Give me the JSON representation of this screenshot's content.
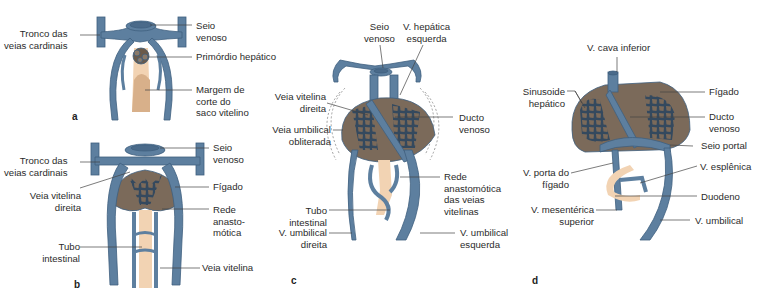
{
  "colors": {
    "vein": "#5d7f9f",
    "vein_dark": "#3f5f7f",
    "liver": "#7b6a5a",
    "intestine": "#f2d3b3",
    "hepatic_primordium": "#6a5a4a",
    "leader_line": "#444444",
    "text": "#2b2b2b"
  },
  "panels": {
    "a": {
      "letter": "a",
      "labels": {
        "tronco": "Tronco das\nveias cardinais",
        "seio": "Seio\nvenoso",
        "primordio": "Primórdio hepático",
        "margem": "Margem de\ncorte do\nsaco vitelino"
      }
    },
    "b": {
      "letter": "b",
      "labels": {
        "tronco": "Tronco das\nveias cardinais",
        "seio": "Seio\nvenoso",
        "vitelina_direita": "Veia vitelina\ndireita",
        "figado": "Fígado",
        "rede": "Rede\nanasto-\nmótica",
        "tubo": "Tubo\nintestinal",
        "veia_vitelina": "Veia vitelina"
      }
    },
    "c": {
      "letter": "c",
      "labels": {
        "seio": "Seio\nvenoso",
        "hepatica_esq": "V. hepática\nesquerda",
        "vitelina_direita": "Veia vitelina\ndireita",
        "umbilical_obliterada": "Veia umbilical\nobliterada",
        "ducto": "Ducto\nvenoso",
        "rede": "Rede\nanastomótica\ndas veias\nvitelinas",
        "tubo": "Tubo\nintestinal",
        "umbilical_direita": "V. umbilical\ndireita",
        "umbilical_esquerda": "V. umbilical\nesquerda"
      }
    },
    "d": {
      "letter": "d",
      "labels": {
        "cava": "V. cava inferior",
        "sinusoide": "Sinusoide\nhepático",
        "figado": "Fígado",
        "ducto": "Ducto\nvenoso",
        "seio_portal": "Seio portal",
        "porta": "V. porta do\nfígado",
        "esplenica": "V. esplênica",
        "duodeno": "Duodeno",
        "mesenterica": "V. mesentérica\nsuperior",
        "umbilical": "V. umbilical"
      }
    }
  }
}
